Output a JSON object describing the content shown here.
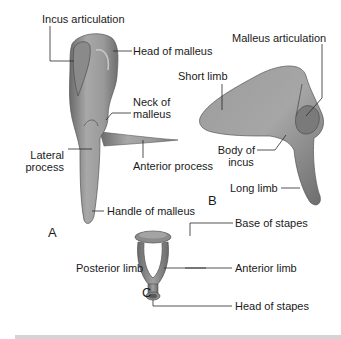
{
  "figure": {
    "panels": [
      {
        "id": "A",
        "letter": "A",
        "bone": "malleus",
        "labels": {
          "incus_articulation": "Incus articulation",
          "head": "Head of malleus",
          "neck_line1": "Neck of",
          "neck_line2": "malleus",
          "lateral_line1": "Lateral",
          "lateral_line2": "process",
          "anterior": "Anterior process",
          "handle": "Handle of malleus"
        }
      },
      {
        "id": "B",
        "letter": "B",
        "bone": "incus",
        "labels": {
          "malleus_articulation": "Malleus articulation",
          "short_limb": "Short limb",
          "body_line1": "Body of",
          "body_line2": "incus",
          "long_limb": "Long limb"
        }
      },
      {
        "id": "C",
        "letter": "C",
        "bone": "stapes",
        "labels": {
          "base": "Base of stapes",
          "posterior": "Posterior limb",
          "anterior": "Anterior limb",
          "head": "Head of stapes"
        }
      }
    ],
    "colors": {
      "bone_light": "#b8b8b8",
      "bone_mid": "#8f8f8f",
      "bone_dark": "#5e5e5e",
      "leader": "#2a2a2a",
      "text": "#1a1a1a",
      "bar": "#d4d4d4"
    }
  }
}
